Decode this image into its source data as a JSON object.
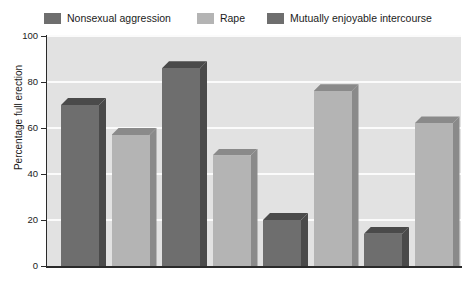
{
  "chart_data": {
    "type": "bar",
    "title": "",
    "xlabel": "",
    "ylabel": "Percentage full erection",
    "ylim": [
      0,
      100
    ],
    "ytick_labels": [
      "0",
      "20",
      "40",
      "60",
      "80",
      "100"
    ],
    "ytick_values": [
      0,
      20,
      40,
      60,
      80,
      100
    ],
    "grid": "horizontal",
    "legend_position": "top-left",
    "categories": [
      "1",
      "2",
      "3",
      "4",
      "5",
      "6",
      "7",
      "8"
    ],
    "bars": [
      {
        "index": 1,
        "value": 70,
        "series": "Nonsexual aggression",
        "color": "#6e6e6e"
      },
      {
        "index": 2,
        "value": 57,
        "series": "Rape",
        "color": "#b4b4b4"
      },
      {
        "index": 3,
        "value": 86,
        "series": "Mutually enjoyable intercourse",
        "color": "#6e6e6e"
      },
      {
        "index": 4,
        "value": 48,
        "series": "Rape",
        "color": "#b4b4b4"
      },
      {
        "index": 5,
        "value": 20,
        "series": "Nonsexual aggression",
        "color": "#6e6e6e"
      },
      {
        "index": 6,
        "value": 76,
        "series": "Rape",
        "color": "#b4b4b4"
      },
      {
        "index": 7,
        "value": 14,
        "series": "Mutually enjoyable intercourse",
        "color": "#6e6e6e"
      },
      {
        "index": 8,
        "value": 62,
        "series": "Rape",
        "color": "#b4b4b4"
      }
    ],
    "values": [
      70,
      57,
      86,
      48,
      20,
      76,
      14,
      62
    ],
    "legend": [
      {
        "label": "Nonsexual aggression",
        "color": "#6e6e6e"
      },
      {
        "label": "Rape",
        "color": "#b4b4b4"
      },
      {
        "label": "Mutually enjoyable intercourse",
        "color": "#6e6e6e"
      }
    ],
    "colors": {
      "plot_background": "#e2e2e2",
      "gridline": "#fbfbfb",
      "axis": "#2a2a2a",
      "bar_dark": "#6e6e6e",
      "bar_dark_side": "#4a4a4a",
      "bar_light": "#b4b4b4",
      "bar_light_side": "#8a8a8a",
      "text": "#1b1b1b"
    }
  }
}
